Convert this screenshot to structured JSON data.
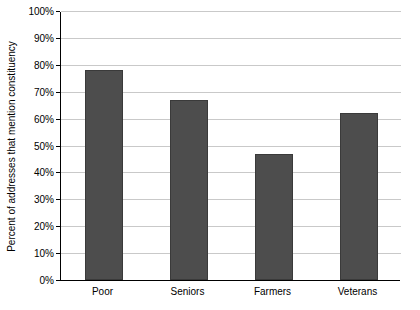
{
  "chart_data": {
    "type": "bar",
    "title": "",
    "subtitle": "",
    "xlabel": "",
    "ylabel": "Percent of addresses that mention constituency",
    "categories": [
      "Poor",
      "Seniors",
      "Farmers",
      "Veterans"
    ],
    "values": [
      78,
      67,
      47,
      62
    ],
    "series": [
      {
        "name": "Percent of addresses that mention constituency",
        "values": [
          78,
          67,
          47,
          62
        ]
      }
    ],
    "ylim": [
      0,
      100
    ],
    "ytick_values": [
      0,
      10,
      20,
      30,
      40,
      50,
      60,
      70,
      80,
      90,
      100
    ],
    "ytick_labels": [
      "0%",
      "10%",
      "20%",
      "30%",
      "40%",
      "50%",
      "60%",
      "70%",
      "80%",
      "90%",
      "100%"
    ],
    "grid": "horizontal",
    "legend": "none",
    "bar_color": "#4d4d4d",
    "bar_border_color": "#3a3a3a",
    "gridline_color": "#c9c9c9",
    "axis_color": "#000000",
    "background_color": "#ffffff"
  }
}
